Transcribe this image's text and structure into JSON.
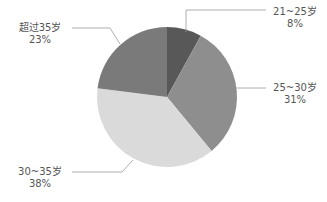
{
  "chart_data": {
    "type": "pie",
    "title": "",
    "categories": [
      "21~25岁",
      "25~30岁",
      "30~35岁",
      "超过35岁"
    ],
    "values": [
      8,
      31,
      38,
      23
    ],
    "colors": [
      "#585858",
      "#8e8e8e",
      "#dadada",
      "#7a7a7a"
    ],
    "start_angle": "12 o'clock",
    "direction": "clockwise",
    "labels": [
      {
        "name": "21~25岁",
        "pct": "8%"
      },
      {
        "name": "25~30岁",
        "pct": "31%"
      },
      {
        "name": "30~35岁",
        "pct": "38%"
      },
      {
        "name": "超过35岁",
        "pct": "23%"
      }
    ]
  }
}
